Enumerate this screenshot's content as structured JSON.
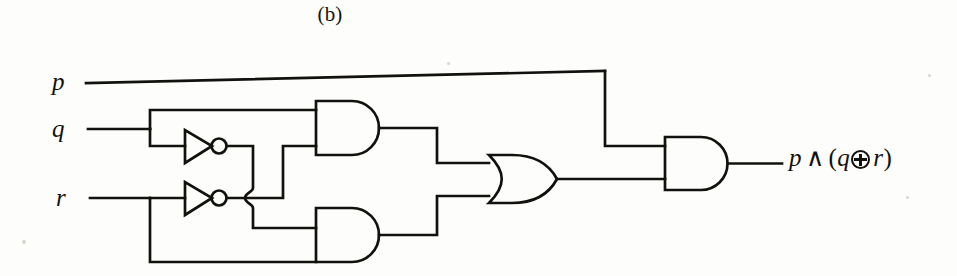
{
  "figure": {
    "caption": "(b)",
    "type": "logic-circuit-diagram"
  },
  "inputs": [
    {
      "name": "p",
      "label": "p",
      "wire_y": 72
    },
    {
      "name": "q",
      "label": "q",
      "wire_y": 129
    },
    {
      "name": "r",
      "label": "r",
      "wire_y": 198
    }
  ],
  "output": {
    "label_parts": {
      "lead": "p",
      "and_symbol": "∧",
      "open_paren": "(",
      "left_operand": "q",
      "xor_symbol": "⊕",
      "right_operand": "r",
      "close_paren": ")"
    },
    "label_text": "p ∧ (q ⊕ r)",
    "icon": "xor-circled-plus-icon"
  },
  "gates": [
    {
      "id": "not-1",
      "type": "NOT",
      "label": "inverter",
      "inputs": [
        "q"
      ],
      "output": "not-q"
    },
    {
      "id": "not-2",
      "type": "NOT",
      "label": "inverter",
      "inputs": [
        "r"
      ],
      "output": "not-r"
    },
    {
      "id": "and-top",
      "type": "AND",
      "label": "AND gate",
      "inputs": [
        "q",
        "not-r"
      ],
      "output": "q-and-not-r"
    },
    {
      "id": "and-bottom",
      "type": "AND",
      "label": "AND gate",
      "inputs": [
        "not-q",
        "r"
      ],
      "output": "not-q-and-r"
    },
    {
      "id": "or-1",
      "type": "OR",
      "label": "OR gate",
      "inputs": [
        "q-and-not-r",
        "not-q-and-r"
      ],
      "output": "q-xor-r"
    },
    {
      "id": "and-final",
      "type": "AND",
      "label": "AND gate",
      "inputs": [
        "p",
        "q-xor-r"
      ],
      "output": "p-and-q-xor-r"
    }
  ],
  "style": {
    "line_color": "#13110d",
    "background": "#fdfdfb",
    "stroke_width": 2.6
  }
}
